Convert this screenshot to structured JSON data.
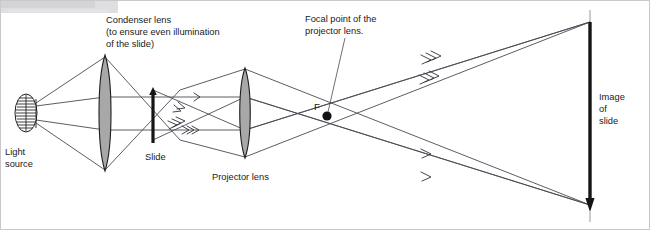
{
  "diagram": {
    "labels": {
      "light_source": "Light\nsource",
      "light_source_line1": "Light",
      "light_source_line2": "source",
      "condenser_line1": "Condenser lens",
      "condenser_line2": "(to ensure even illumination",
      "condenser_line3": "of the slide)",
      "slide": "Slide",
      "projector_lens": "Projector lens",
      "focal_line1": "Focal point of the",
      "focal_line2": "projector lens.",
      "focal_marker": "F",
      "image_line1": "Image",
      "image_line2": "of",
      "image_line3": "slide"
    },
    "colors": {
      "background": "#ffffff",
      "lens_fill": "#a8a8a8",
      "lens_stroke": "#1d1d1d",
      "ray_stroke": "#4a4a52",
      "text": "#1a1a1a",
      "object_arrow": "#151515",
      "smudge": "#d8d8dc"
    },
    "components": [
      {
        "name": "light-source",
        "type": "coiled-filament-lamp",
        "x": 26,
        "y": 113
      },
      {
        "name": "condenser-lens",
        "type": "biconvex-lens",
        "x": 105,
        "y": 113,
        "half_height": 57
      },
      {
        "name": "slide",
        "type": "upright-object-arrow",
        "x": 153,
        "y": 113,
        "top": 90,
        "bottom": 140
      },
      {
        "name": "projector-lens",
        "type": "biconvex-lens",
        "x": 245,
        "y": 113,
        "half_height": 44
      },
      {
        "name": "focal-point",
        "type": "point-marker",
        "x": 327,
        "y": 116
      },
      {
        "name": "image-of-slide",
        "type": "inverted-image-arrow",
        "x": 590,
        "top": 20,
        "bottom": 205
      }
    ],
    "ray_arrow_counts": {
      "upper_inner": 1,
      "mid_inner": 2,
      "lower_inner": 3,
      "right_upper_a": 3,
      "right_upper_b": 3,
      "right_lower_a": 1,
      "right_lower_b": 1
    }
  }
}
